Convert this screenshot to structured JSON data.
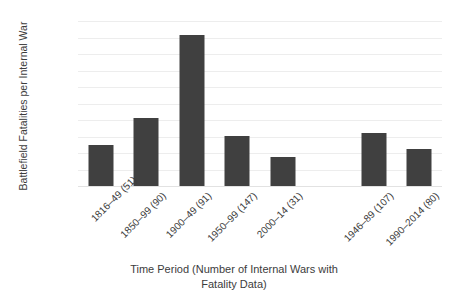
{
  "chart_data": {
    "type": "bar",
    "title": "",
    "xlabel_line1": "Time Period (Number of Internal Wars with",
    "xlabel_line2": "Fatality Data)",
    "ylabel": "Battlefield Fatalities per Internal War",
    "categories": [
      "1816–49 (51)",
      "1850–99 (90)",
      "1900–49 (91)",
      "1950–99 (147)",
      "2000–14 (31)",
      "",
      "1946–89 (107)",
      "1990–2014 (80)"
    ],
    "values": [
      12400,
      20500,
      45800,
      15200,
      8800,
      null,
      16200,
      11200
    ],
    "ylim": [
      0,
      50000
    ],
    "ytick_values": [
      50000,
      45000,
      40000,
      35000,
      30000,
      25000,
      20000,
      15000,
      10000,
      5000,
      0
    ],
    "ytick_labels": [
      "50000",
      "45000",
      "40000",
      "35000",
      "30000",
      "25000",
      "20000",
      "15000",
      "10000",
      "5000",
      "0"
    ],
    "grid": true,
    "legend": "none",
    "bar_color": "#404040",
    "grid_color": "#ededed",
    "text_color": "#3c3c3c",
    "background": "#ffffff"
  },
  "clipped_top_text": ""
}
